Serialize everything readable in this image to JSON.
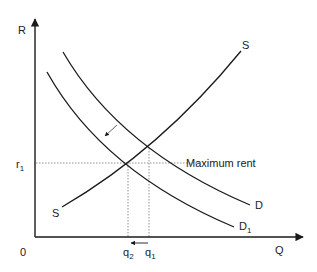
{
  "diagram": {
    "axes": {
      "y_label": "R",
      "x_label": "Q",
      "origin_label": "0"
    },
    "curves": {
      "supply": {
        "label_top": "S",
        "label_bottom": "S"
      },
      "demand": {
        "label": "D"
      },
      "demand_shifted": {
        "label": "D",
        "subscript": "1"
      }
    },
    "price_line": {
      "label": "r",
      "subscript": "1",
      "annotation": "Maximum rent"
    },
    "quantity_marks": [
      {
        "label": "q",
        "subscript": "2"
      },
      {
        "label": "q",
        "subscript": "1"
      }
    ],
    "colors": {
      "line": "#1a1a1a",
      "dashed": "#666666",
      "background": "#ffffff"
    }
  }
}
